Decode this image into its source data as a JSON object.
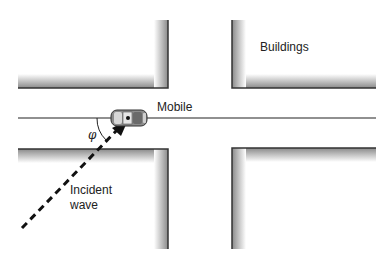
{
  "diagram": {
    "labels": {
      "buildings": "Buildings",
      "mobile": "Mobile",
      "angle": "φ",
      "incident_line1": "Incident",
      "incident_line2": "wave"
    },
    "colors": {
      "edge": "#333333",
      "shadow_dark": "#8a8a8a",
      "shadow_light": "#ffffff",
      "car_body": "#8c8c8c",
      "car_window": "#e0e0e0",
      "line": "#222222"
    },
    "elements": {
      "buildings": [
        "top-left",
        "top-right",
        "bottom-left",
        "bottom-right"
      ],
      "street_line": "horizontal road line through intersection",
      "mobile": "car at intersection on road",
      "incident_wave": "dashed arrow from lower-left to mobile",
      "angle_arc": "arc between road line and incident wave"
    }
  }
}
